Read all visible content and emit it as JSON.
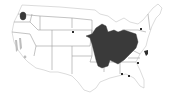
{
  "map": {
    "title": "",
    "region": "Contiguous United States",
    "type": "species range / distribution map",
    "colors": {
      "background": "#ffffff",
      "state_fill": "#ffffff",
      "state_border": "#b8b8b8",
      "range_primary": "#3a3a3a",
      "range_secondary": "#bdbdbd",
      "occurrence_dot": "#2f2f2f"
    },
    "ranges": [
      {
        "name": "main-range",
        "description": "Midwest / Ohio Valley / Great Lakes region",
        "shade": "dark"
      },
      {
        "name": "pacific-northwest-patch",
        "description": "Western Washington",
        "shade": "dark"
      },
      {
        "name": "california-patches",
        "description": "Central California valleys",
        "shade": "light"
      }
    ],
    "occurrence_points": [
      {
        "location": "South Dakota"
      },
      {
        "location": "New York"
      },
      {
        "location": "Virginia / North Carolina"
      },
      {
        "location": "South Carolina"
      },
      {
        "location": "Georgia / Alabama"
      },
      {
        "location": "Florida panhandle"
      }
    ]
  }
}
